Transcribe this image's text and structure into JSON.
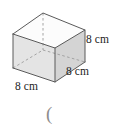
{
  "figure": {
    "name": "cube-diagram",
    "shape": "cube",
    "labels": {
      "height": "8 cm",
      "depth": "8 cm",
      "width": "8 cm"
    },
    "trailing_mark": "(",
    "colors": {
      "edge": "#555555",
      "hidden_edge": "#9a9a9a",
      "front_face": "#e3e3e3",
      "right_face": "#d3d3d3",
      "top_face": "#fbfbfb",
      "text": "#1d1d1d",
      "background": "#ffffff"
    }
  }
}
